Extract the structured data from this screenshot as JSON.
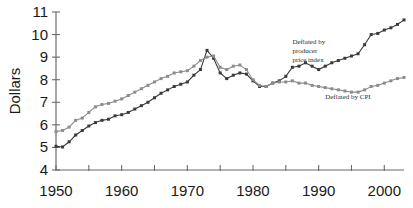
{
  "chart_data": {
    "type": "line",
    "title": "",
    "xlabel": "",
    "ylabel": "Dollars",
    "xlim": [
      1950,
      2003
    ],
    "ylim": [
      4,
      11
    ],
    "grid": false,
    "legend_position": "inline-annotations",
    "xticks": [
      1950,
      1955,
      1960,
      1965,
      1970,
      1975,
      1980,
      1985,
      1990,
      1995,
      2000
    ],
    "xticklabels": [
      "1950",
      "",
      "1960",
      "",
      "1970",
      "",
      "1980",
      "",
      "1990",
      "",
      "2000"
    ],
    "yticks": [
      4,
      5,
      6,
      7,
      8,
      9,
      10,
      11
    ],
    "yticklabels": [
      "4",
      "5",
      "6",
      "7",
      "8",
      "9",
      "10",
      "11"
    ],
    "x": [
      1950,
      1951,
      1952,
      1953,
      1954,
      1955,
      1956,
      1957,
      1958,
      1959,
      1960,
      1961,
      1962,
      1963,
      1964,
      1965,
      1966,
      1967,
      1968,
      1969,
      1970,
      1971,
      1972,
      1973,
      1974,
      1975,
      1976,
      1977,
      1978,
      1979,
      1980,
      1981,
      1982,
      1983,
      1984,
      1985,
      1986,
      1987,
      1988,
      1989,
      1990,
      1991,
      1992,
      1993,
      1994,
      1995,
      1996,
      1997,
      1998,
      1999,
      2000,
      2001,
      2002,
      2003
    ],
    "series": [
      {
        "name": "Deflated by producer price index",
        "color": "#3a3a3a",
        "marker": "square",
        "values": [
          5.05,
          5.02,
          5.25,
          5.55,
          5.75,
          5.95,
          6.1,
          6.2,
          6.25,
          6.4,
          6.45,
          6.55,
          6.7,
          6.85,
          7.0,
          7.2,
          7.4,
          7.55,
          7.7,
          7.8,
          7.9,
          8.2,
          8.45,
          9.3,
          8.95,
          8.3,
          8.05,
          8.2,
          8.3,
          8.25,
          7.95,
          7.7,
          7.7,
          7.85,
          7.95,
          8.15,
          8.55,
          8.6,
          8.75,
          8.6,
          8.45,
          8.6,
          8.75,
          8.85,
          8.95,
          9.05,
          9.15,
          9.55,
          10.0,
          10.05,
          10.2,
          10.3,
          10.45,
          10.65
        ]
      },
      {
        "name": "Deflated by CPI",
        "color": "#8c8c8c",
        "marker": "square",
        "values": [
          5.7,
          5.75,
          5.9,
          6.2,
          6.3,
          6.55,
          6.8,
          6.9,
          6.95,
          7.05,
          7.15,
          7.3,
          7.45,
          7.6,
          7.75,
          7.9,
          8.05,
          8.15,
          8.3,
          8.35,
          8.4,
          8.6,
          8.85,
          9.0,
          9.05,
          8.55,
          8.45,
          8.6,
          8.65,
          8.45,
          8.0,
          7.75,
          7.7,
          7.85,
          7.9,
          7.9,
          7.95,
          7.85,
          7.85,
          7.75,
          7.7,
          7.65,
          7.6,
          7.55,
          7.5,
          7.45,
          7.45,
          7.55,
          7.7,
          7.75,
          7.85,
          7.95,
          8.05,
          8.1
        ]
      }
    ],
    "annotations": [
      {
        "name": "ppi-series-label",
        "lines": [
          "Deflated by",
          "producer",
          "price index"
        ],
        "x": 1986,
        "y": 9.6
      },
      {
        "name": "cpi-series-label",
        "lines": [
          "Deflated by CPI"
        ],
        "x": 1991,
        "y": 7.15
      }
    ]
  }
}
